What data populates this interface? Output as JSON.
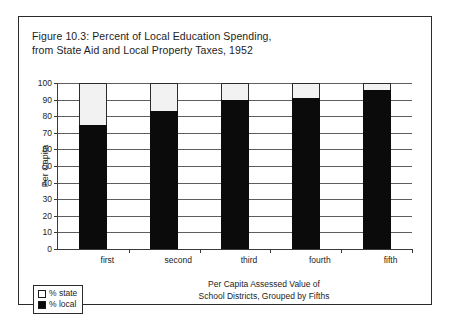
{
  "figure": {
    "title_line1": "Figure 10.3: Percent of Local Education Spending,",
    "title_line2": "from State Aid and Local Property Taxes, 1952"
  },
  "legend": {
    "items": [
      {
        "label": "% state",
        "swatch": "white-square-icon",
        "color": "#ffffff"
      },
      {
        "label": "% local",
        "swatch": "black-square-icon",
        "color": "#0b0b0b"
      }
    ]
  },
  "axes": {
    "y_title": "Per Capita",
    "x_title_line1": "Per Capita Assessed Value of",
    "x_title_line2": "School Districts, Grouped by Fifths"
  },
  "chart_data": {
    "type": "bar",
    "stacked": true,
    "title": "Figure 10.3: Percent of Local Education Spending, from State Aid and Local Property Taxes, 1952",
    "xlabel": "Per Capita Assessed Value of School Districts, Grouped by Fifths",
    "ylabel": "Per Capita",
    "categories": [
      "first",
      "second",
      "third",
      "fourth",
      "fifth"
    ],
    "series": [
      {
        "name": "% state",
        "values": [
          25,
          17,
          10,
          9,
          4
        ],
        "color": "#ffffff"
      },
      {
        "name": "% local",
        "values": [
          75,
          83,
          90,
          91,
          96
        ],
        "color": "#0b0b0b"
      }
    ],
    "ylim": [
      0,
      100
    ],
    "yticks": [
      0,
      10,
      20,
      30,
      40,
      50,
      60,
      70,
      80,
      90,
      100
    ],
    "ytick_labels": [
      "0",
      "10",
      "20",
      "30",
      "40",
      "50",
      "60",
      "70",
      "80",
      "90",
      "100"
    ],
    "grid": true,
    "legend_position": "bottom-left"
  }
}
